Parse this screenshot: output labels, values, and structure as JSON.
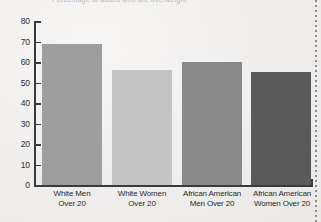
{
  "page": {
    "background_color": "#efeeec",
    "title_sliver_text": "Percentage of adults who are overweight",
    "scan_artifact": "dotted-edge-line"
  },
  "chart_data": {
    "type": "bar",
    "title": "",
    "xlabel": "",
    "ylabel": "",
    "ylim": [
      0,
      80
    ],
    "ytick_step": 10,
    "grid": false,
    "legend": "none",
    "categories": [
      "White Men\nOver 20",
      "White Women\nOver 20",
      "African American\nMen Over 20",
      "African American\nWomen Over 20"
    ],
    "values": [
      69,
      56,
      60,
      55
    ],
    "bar_colors": [
      "#9e9e9e",
      "#c4c4c4",
      "#8a8a8a",
      "#5a5a5a"
    ],
    "ytick_labels": [
      "80",
      "70",
      "60",
      "50",
      "40",
      "30",
      "20",
      "10",
      "0"
    ],
    "ytick_values": [
      80,
      70,
      60,
      50,
      40,
      30,
      20,
      10,
      0
    ]
  },
  "axis": {
    "y_axis_color": "#3a3a3a",
    "x_axis_color": "#3a3a3a"
  },
  "categories_display": [
    {
      "line1": "White Men",
      "line2": "Over 20"
    },
    {
      "line1": "White Women",
      "line2": "Over 20"
    },
    {
      "line1": "African American",
      "line2": "Men Over 20"
    },
    {
      "line1": "African American",
      "line2": "Women Over 20"
    }
  ]
}
